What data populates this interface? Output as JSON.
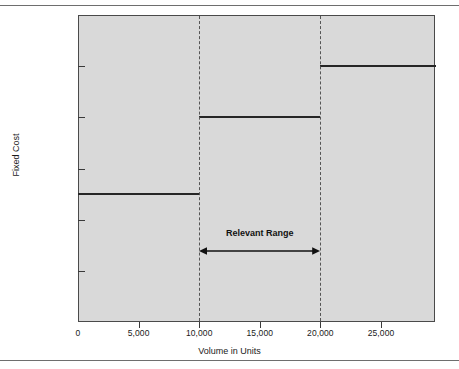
{
  "chart_data": {
    "type": "line",
    "title": "",
    "subtitle": "",
    "xlabel": "Volume in Units",
    "ylabel": "Fixed Cost",
    "xlim": [
      0,
      29500
    ],
    "ylim": [
      0,
      120000
    ],
    "x_ticks": [
      {
        "value": 0,
        "label": "0"
      },
      {
        "value": 5000,
        "label": "5,000"
      },
      {
        "value": 10000,
        "label": "10,000"
      },
      {
        "value": 15000,
        "label": "15,000"
      },
      {
        "value": 20000,
        "label": "20,000"
      },
      {
        "value": 25000,
        "label": "25,000"
      }
    ],
    "y_ticks": [
      {
        "value": 120000,
        "label": "$120,000"
      },
      {
        "value": 100000,
        "label": "100,000"
      },
      {
        "value": 80000,
        "label": "80,000"
      },
      {
        "value": 60000,
        "label": "60,000"
      },
      {
        "value": 40000,
        "label": "40,000"
      },
      {
        "value": 20000,
        "label": "20,000"
      }
    ],
    "grid": false,
    "legend": null,
    "series": [
      {
        "name": "Fixed Cost",
        "style": "step",
        "color": "#262626",
        "steps": [
          {
            "x_start": 0,
            "x_end": 10000,
            "y": 50000
          },
          {
            "x_start": 10000,
            "x_end": 20000,
            "y": 80000
          },
          {
            "x_start": 20000,
            "x_end": 29500,
            "y": 100000
          }
        ]
      }
    ],
    "annotations": [
      {
        "name": "relevant-range",
        "label": "Relevant Range",
        "x_start": 10000,
        "x_end": 20000,
        "marker": "double-headed-arrow",
        "color": "#111111"
      },
      {
        "name": "range-boundary-lower",
        "type": "vertical-dashed-line",
        "x": 10000,
        "color": "#555555"
      },
      {
        "name": "range-boundary-upper",
        "type": "vertical-dashed-line",
        "x": 20000,
        "color": "#555555"
      }
    ],
    "colors": {
      "plot_background": "#d9d9d9",
      "page_background": "#ffffff",
      "axis": "#4a4a4a",
      "step_line": "#262626",
      "dashed_line": "#555555",
      "rule": "#6e6e6e"
    }
  }
}
